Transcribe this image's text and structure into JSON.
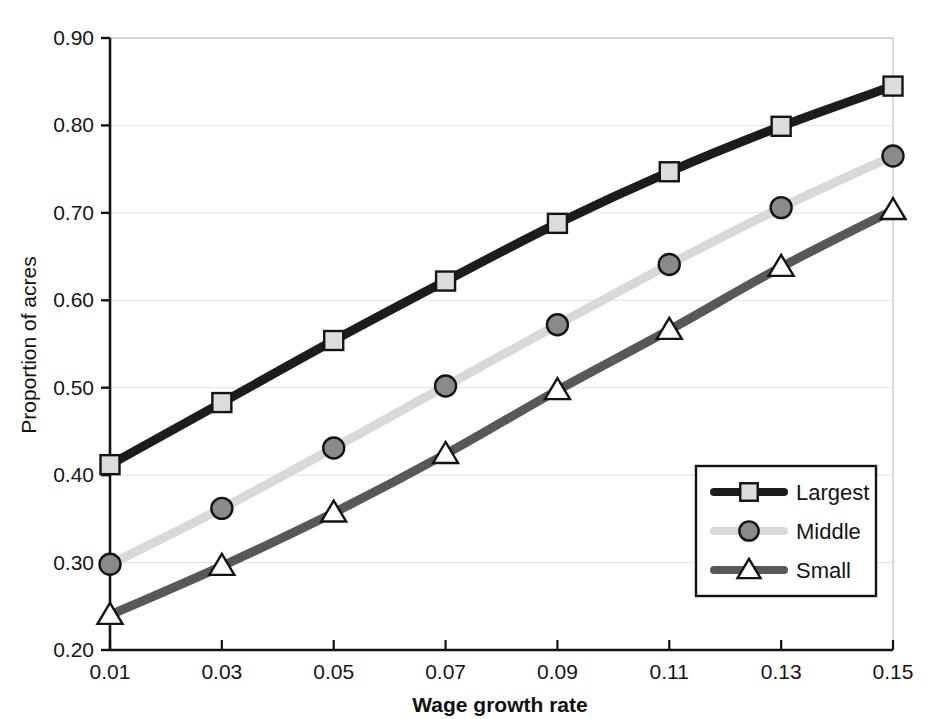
{
  "chart_data": {
    "type": "line",
    "title": "",
    "xlabel": "Wage growth rate",
    "ylabel": "Proportion of acres",
    "x": [
      0.01,
      0.03,
      0.05,
      0.07,
      0.09,
      0.11,
      0.13,
      0.15
    ],
    "xtick_labels": [
      "0.01",
      "0.03",
      "0.05",
      "0.07",
      "0.09",
      "0.11",
      "0.13",
      "0.15"
    ],
    "ytick_labels": [
      "0.20",
      "0.30",
      "0.40",
      "0.50",
      "0.60",
      "0.70",
      "0.80",
      "0.90"
    ],
    "ytick_values": [
      0.2,
      0.3,
      0.4,
      0.5,
      0.6,
      0.7,
      0.8,
      0.9
    ],
    "xlim": [
      0.01,
      0.15
    ],
    "ylim": [
      0.2,
      0.9
    ],
    "grid": "horizontal",
    "legend_position": "lower-right-inside",
    "series": [
      {
        "name": "Largest",
        "color": "#1c1c1c",
        "marker": "square",
        "marker_fill": "#dcdcdc",
        "marker_edge": "#141414",
        "values": [
          0.412,
          0.483,
          0.554,
          0.622,
          0.688,
          0.747,
          0.799,
          0.845
        ]
      },
      {
        "name": "Middle",
        "color": "#d9d9d9",
        "marker": "circle",
        "marker_fill": "#8a8a8a",
        "marker_edge": "#141414",
        "values": [
          0.298,
          0.362,
          0.431,
          0.502,
          0.572,
          0.641,
          0.706,
          0.765
        ]
      },
      {
        "name": "Small",
        "color": "#585858",
        "marker": "triangle",
        "marker_fill": "#ffffff",
        "marker_edge": "#141414",
        "values": [
          0.24,
          0.296,
          0.357,
          0.424,
          0.497,
          0.566,
          0.638,
          0.703
        ]
      }
    ]
  },
  "legend": {
    "entries": [
      {
        "label": "Largest"
      },
      {
        "label": "Middle"
      },
      {
        "label": "Small"
      }
    ]
  },
  "axes": {
    "x_title": "Wage growth rate",
    "y_title": "Proportion of acres"
  },
  "colors": {
    "axis": "#111111",
    "grid": "#e2e2e2",
    "plot_background": "#ffffff",
    "legend_border": "#111111"
  }
}
